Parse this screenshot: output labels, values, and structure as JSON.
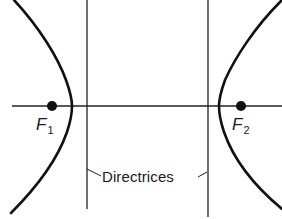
{
  "diagram": {
    "type": "hyperbola-with-foci-and-directrices",
    "colors": {
      "background": "#ffffff",
      "curve": "#111111",
      "lines": "#222222",
      "text": "#1a1a1a"
    },
    "foci": [
      {
        "id": "F1",
        "symbol": "F",
        "subscript": "1",
        "x": 52,
        "y": 106
      },
      {
        "id": "F2",
        "symbol": "F",
        "subscript": "2",
        "x": 241,
        "y": 106
      }
    ],
    "directrices": {
      "label": "Directrices",
      "lines": [
        {
          "x": 87,
          "y1": 0,
          "y2": 209
        },
        {
          "x": 208,
          "y1": 0,
          "y2": 217
        }
      ]
    },
    "axis": {
      "y": 106,
      "x1": 12,
      "x2": 282
    },
    "branches": [
      {
        "name": "left-branch",
        "vertex_x": 72
      },
      {
        "name": "right-branch",
        "vertex_x": 219
      }
    ]
  }
}
